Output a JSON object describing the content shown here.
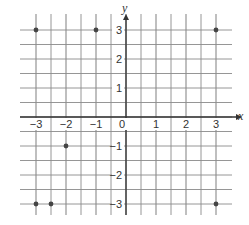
{
  "chart_data": {
    "type": "scatter",
    "title": "",
    "xlabel": "x",
    "ylabel": "y",
    "xlim": [
      -3.5,
      3.5
    ],
    "ylim": [
      -3.5,
      3.5
    ],
    "grid": true,
    "grid_step": 0.5,
    "x_ticks": [
      -3,
      -2,
      -1,
      0,
      1,
      2,
      3
    ],
    "y_ticks": [
      -3,
      -2,
      -1,
      1,
      2,
      3
    ],
    "x_tick_labels": [
      "−3",
      "−2",
      "−1",
      "0",
      "1",
      "2",
      "3"
    ],
    "y_tick_labels": [
      "−3",
      "−2",
      "−1",
      "1",
      "2",
      "3"
    ],
    "points": [
      {
        "x": -3,
        "y": 3
      },
      {
        "x": -1,
        "y": 3
      },
      {
        "x": 3,
        "y": 3
      },
      {
        "x": -2,
        "y": -1
      },
      {
        "x": -3,
        "y": -3
      },
      {
        "x": -2.5,
        "y": -3
      },
      {
        "x": 3,
        "y": -3
      }
    ]
  },
  "colors": {
    "grid": "#8a8a8a",
    "axis": "#333333",
    "point": "#444444"
  }
}
